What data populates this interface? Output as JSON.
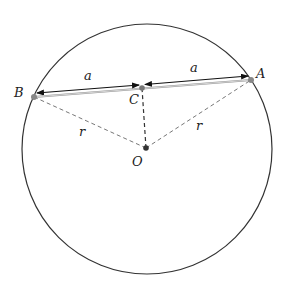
{
  "diagram": {
    "points": {
      "A": {
        "label": "A",
        "x": 251,
        "y": 80
      },
      "B": {
        "label": "B",
        "x": 34,
        "y": 97
      },
      "C": {
        "label": "C",
        "x": 142,
        "y": 88
      },
      "O": {
        "label": "O",
        "x": 146,
        "y": 148
      }
    },
    "circle": {
      "cx": 147,
      "cy": 149,
      "r": 125
    },
    "segments": {
      "BC_label": "a",
      "CA_label": "a",
      "OB_label": "r",
      "OA_label": "r"
    },
    "colors": {
      "circle": "#333333",
      "chord": "#999999",
      "radius": "#777777",
      "altitude": "#333333",
      "arrow": "#111111",
      "point_gray": "#888888",
      "point_dark": "#333333"
    }
  }
}
